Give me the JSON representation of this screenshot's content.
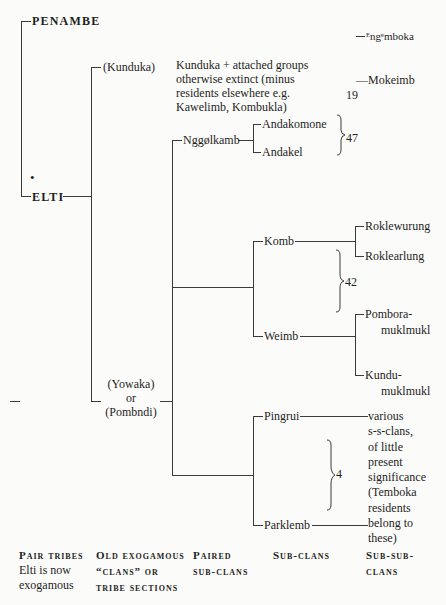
{
  "tribes": {
    "penambe": "PENAMBE",
    "elti": "ELTI",
    "elti_marker": "•"
  },
  "clans": {
    "kunduka": "(Kunduka)",
    "kunduka_note": [
      "Kunduka + attached groups",
      "otherwise extinct (minus",
      "residents elsewhere e.g.",
      "Kawelimb, Kombukla)"
    ],
    "yowaka_lines": [
      "(Yowaka)",
      "or",
      "(Pombndi)"
    ]
  },
  "penambe_subclans": {
    "engemboka": "ᴱngᵉmboka",
    "mokeimb": "—Mokeimb",
    "count": "19"
  },
  "paired_subclans": {
    "nggolkamb": "Nggølkamb",
    "komb": "Komb",
    "weimb": "Weimb",
    "pingrui": "Pingrui",
    "parklemb": "Parklemb"
  },
  "subclans": {
    "andakomone": "Andakomone",
    "andakel": "Andakel",
    "andak_count": "47",
    "roklewurung": "Roklewurung",
    "roklearlung": "Roklearlung",
    "pombora": [
      "Pombora-",
      "muklmukl"
    ],
    "kundu": [
      "Kundu-",
      "muklmukl"
    ],
    "komb_count": "42",
    "ping_count": "4"
  },
  "subsubclans": {
    "various_note": [
      "various",
      "s-s-clans,",
      "of little",
      "present",
      "significance",
      "(Temboka",
      "residents",
      "belong to",
      "these)"
    ]
  },
  "legend": {
    "col1": [
      "Pair tribes",
      "Elti is now",
      "exogamous"
    ],
    "col2": [
      "Old exogamous",
      "“clans” or",
      "tribe sections"
    ],
    "col3": [
      "Paired",
      "sub-clans"
    ],
    "col4": [
      "Sub-clans"
    ],
    "col5": [
      "Sub-sub-",
      "clans"
    ]
  }
}
